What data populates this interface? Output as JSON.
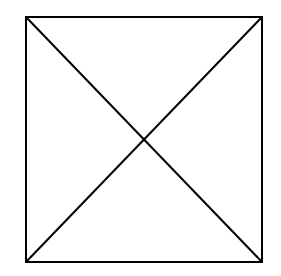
{
  "diagram": {
    "stroke_color": "#000000",
    "background_color": "#ffffff",
    "stroke_width": 2,
    "square": {
      "x1": 26,
      "y1": 17,
      "x2": 262,
      "y2": 262
    },
    "diagonals": [
      {
        "from": [
          26,
          17
        ],
        "to": [
          262,
          262
        ]
      },
      {
        "from": [
          262,
          17
        ],
        "to": [
          26,
          262
        ]
      }
    ],
    "intersection": [
      144,
      139
    ]
  }
}
